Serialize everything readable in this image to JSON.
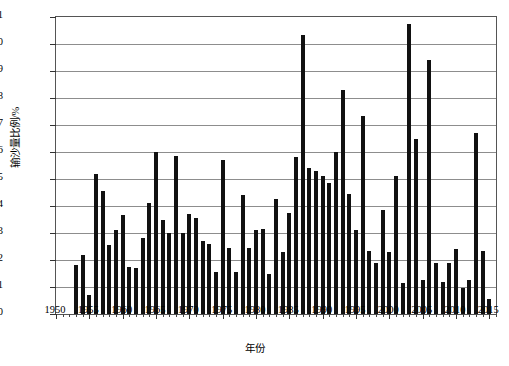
{
  "chart": {
    "type": "bar",
    "ylabel": "输沙量比例/%",
    "xlabel": "年份",
    "bar_color": "#111111",
    "grid": "horizontal"
  },
  "chart_data": {
    "type": "bar",
    "title": "",
    "xlabel": "年份",
    "ylabel": "输沙量比例/%",
    "xlim": [
      1950,
      2016
    ],
    "ylim": [
      0,
      11
    ],
    "ytick_labels": [
      "0",
      "1",
      "2",
      "3",
      "4",
      "5",
      "6",
      "7",
      "8",
      "9",
      "10",
      "11"
    ],
    "ytick_values": [
      0,
      1,
      2,
      3,
      4,
      5,
      6,
      7,
      8,
      9,
      10,
      11
    ],
    "xtick_labels": [
      "1950",
      "1955",
      "1960",
      "1965",
      "1970",
      "1975",
      "1980",
      "1985",
      "1990",
      "1995",
      "2000",
      "2005",
      "2010",
      "2015"
    ],
    "xtick_values": [
      1950,
      1955,
      1960,
      1965,
      1970,
      1975,
      1980,
      1985,
      1990,
      1995,
      2000,
      2005,
      2010,
      2015
    ],
    "grid": "horizontal",
    "legend": null,
    "categories": [
      1953,
      1954,
      1955,
      1956,
      1957,
      1958,
      1959,
      1960,
      1961,
      1962,
      1963,
      1964,
      1965,
      1966,
      1967,
      1968,
      1969,
      1970,
      1971,
      1972,
      1973,
      1974,
      1975,
      1976,
      1977,
      1978,
      1979,
      1980,
      1981,
      1982,
      1983,
      1984,
      1985,
      1986,
      1987,
      1988,
      1989,
      1990,
      1991,
      1992,
      1993,
      1994,
      1995,
      1996,
      1997,
      1998,
      1999,
      2000,
      2001,
      2002,
      2003,
      2004,
      2005,
      2006,
      2007,
      2008,
      2009,
      2010,
      2011,
      2012,
      2013,
      2014,
      2015
    ],
    "values": [
      1.8,
      2.2,
      0.7,
      5.2,
      4.55,
      2.55,
      3.1,
      3.65,
      1.75,
      1.7,
      2.8,
      4.1,
      6.0,
      3.5,
      3.0,
      5.85,
      3.0,
      3.7,
      3.55,
      2.7,
      2.6,
      1.55,
      5.7,
      2.45,
      1.55,
      4.4,
      2.45,
      3.1,
      3.15,
      1.5,
      4.25,
      2.3,
      3.75,
      5.8,
      10.35,
      5.4,
      5.3,
      5.1,
      4.85,
      6.0,
      8.3,
      4.45,
      3.1,
      7.35,
      2.35,
      1.9,
      3.85,
      2.3,
      5.1,
      1.15,
      10.75,
      6.5,
      1.25,
      9.4,
      1.9,
      1.2,
      1.9,
      2.4,
      0.95,
      1.25,
      6.7,
      2.35,
      0.55
    ]
  }
}
